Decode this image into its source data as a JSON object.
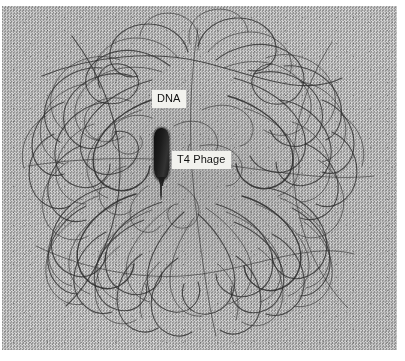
{
  "figure": {
    "kind": "transmission-electron-micrograph",
    "width_px": 405,
    "height_px": 361
  },
  "plate": {
    "background_color": "#d2d2d2",
    "filament_color": "#2e2e2e",
    "particle_color": "#0d0d0d"
  },
  "labels": {
    "dna": {
      "text": "DNA",
      "x": 150,
      "y": 84,
      "box_color": "#f2f2ee",
      "text_color": "#111111"
    },
    "t4_phage": {
      "text": "T4 Phage",
      "x": 170,
      "y": 145,
      "box_color": "#f2f2ee",
      "text_color": "#111111"
    }
  },
  "phage": {
    "name": "T4 Phage",
    "x": 150,
    "y": 122,
    "capsid_width_px": 15,
    "capsid_height_px": 52,
    "tail_length_px": 16
  }
}
